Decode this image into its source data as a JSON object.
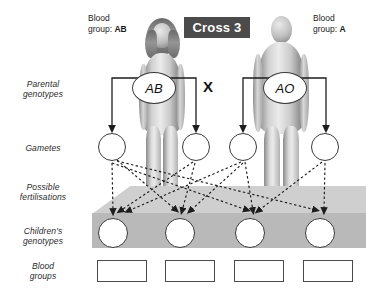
{
  "diagram": {
    "title": "Cross 3",
    "row_labels": [
      {
        "name": "parental-genotypes",
        "line1": "Parental",
        "line2": "genotypes"
      },
      {
        "name": "gametes",
        "line1": "Gametes",
        "line2": ""
      },
      {
        "name": "possible-fertilisations",
        "line1": "Possible",
        "line2": "fertilisations"
      },
      {
        "name": "childrens-genotypes",
        "line1": "Children's",
        "line2": "genotypes"
      },
      {
        "name": "blood-groups",
        "line1": "Blood",
        "line2": "groups"
      }
    ],
    "cross_symbol": "X",
    "parents": [
      {
        "side": "left",
        "sex": "female",
        "caption_line1": "Blood",
        "caption_line2_prefix": "group: ",
        "blood_group": "AB",
        "genotype": "AB"
      },
      {
        "side": "right",
        "sex": "male",
        "caption_line1": "Blood",
        "caption_line2_prefix": "group: ",
        "blood_group": "A",
        "genotype": "AO"
      }
    ],
    "gametes": [
      {
        "index": 1,
        "parent": "left",
        "value": ""
      },
      {
        "index": 2,
        "parent": "left",
        "value": ""
      },
      {
        "index": 3,
        "parent": "right",
        "value": ""
      },
      {
        "index": 4,
        "parent": "right",
        "value": ""
      }
    ],
    "children_genotypes": [
      {
        "index": 1,
        "value": ""
      },
      {
        "index": 2,
        "value": ""
      },
      {
        "index": 3,
        "value": ""
      },
      {
        "index": 4,
        "value": ""
      }
    ],
    "children_blood_groups": [
      {
        "index": 1,
        "value": ""
      },
      {
        "index": 2,
        "value": ""
      },
      {
        "index": 3,
        "value": ""
      },
      {
        "index": 4,
        "value": ""
      }
    ],
    "colors": {
      "badge_background": "#4b4b4b",
      "badge_text": "#ffffff",
      "slab_top": "#cfcfcf",
      "slab_face": "#b9b9b9",
      "circle_stroke": "#3a3a3a",
      "box_stroke": "#4a4a4a",
      "page_background": "#ffffff",
      "label_text": "#2b2b2b"
    }
  }
}
